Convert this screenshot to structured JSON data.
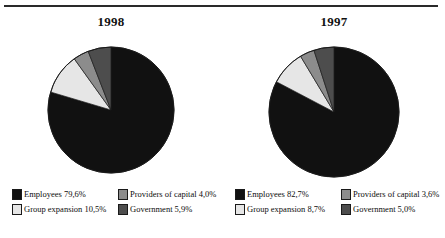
{
  "page": {
    "background": "#ffffff",
    "rule_color": "#2a2a2a"
  },
  "palette": {
    "employees": "#111111",
    "group_expansion": "#e6e6e6",
    "providers_of_capital": "#8c8c8c",
    "government": "#4d4d4d",
    "outline": "#1a1a1a"
  },
  "panels": [
    {
      "id": "panel-1998",
      "title": "1998",
      "legend": [
        {
          "label": "Employees 79,6%",
          "key": "employees",
          "color": "#111111"
        },
        {
          "label": "Providers of capital 4,0%",
          "key": "providers_of_capital",
          "color": "#8c8c8c"
        },
        {
          "label": "Group expansion 10,5%",
          "key": "group_expansion",
          "color": "#e6e6e6"
        },
        {
          "label": "Government 5,9%",
          "key": "government",
          "color": "#4d4d4d"
        }
      ]
    },
    {
      "id": "panel-1997",
      "title": "1997",
      "legend": [
        {
          "label": "Employees 82,7%",
          "key": "employees",
          "color": "#111111"
        },
        {
          "label": "Providers of capital 3,6%",
          "key": "providers_of_capital",
          "color": "#8c8c8c"
        },
        {
          "label": "Group expansion 8,7%",
          "key": "group_expansion",
          "color": "#e6e6e6"
        },
        {
          "label": "Government 5,0%",
          "key": "government",
          "color": "#4d4d4d"
        }
      ]
    }
  ],
  "chart_data": [
    {
      "type": "pie",
      "title": "1998",
      "categories": [
        "Employees",
        "Group expansion",
        "Providers of capital",
        "Government"
      ],
      "values": [
        79.6,
        10.5,
        4.0,
        5.9
      ],
      "labels": [
        "Employees 79,6%",
        "Group expansion 10,5%",
        "Providers of capital 4,0%",
        "Government 5,9%"
      ],
      "colors": [
        "#111111",
        "#e6e6e6",
        "#8c8c8c",
        "#4d4d4d"
      ],
      "unit": "%",
      "start_angle_deg": 0,
      "direction": "clockwise",
      "legend_position": "bottom",
      "grid": false,
      "xlabel": "",
      "ylabel": ""
    },
    {
      "type": "pie",
      "title": "1997",
      "categories": [
        "Employees",
        "Group expansion",
        "Providers of capital",
        "Government"
      ],
      "values": [
        82.7,
        8.7,
        3.6,
        5.0
      ],
      "labels": [
        "Employees 82,7%",
        "Group expansion 8,7%",
        "Providers of capital 3,6%",
        "Government 5,0%"
      ],
      "colors": [
        "#111111",
        "#e6e6e6",
        "#8c8c8c",
        "#4d4d4d"
      ],
      "unit": "%",
      "start_angle_deg": 0,
      "direction": "clockwise",
      "legend_position": "bottom",
      "grid": false,
      "xlabel": "",
      "ylabel": ""
    }
  ]
}
